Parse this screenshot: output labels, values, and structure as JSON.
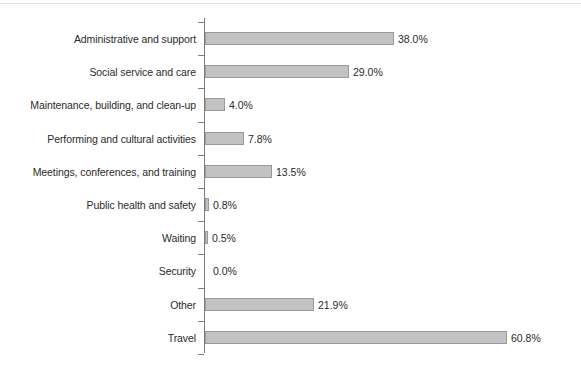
{
  "chart_data": {
    "type": "bar",
    "orientation": "horizontal",
    "title": "",
    "subtitle": "",
    "xlabel": "",
    "ylabel": "",
    "grid": false,
    "legend": false,
    "value_suffix": "%",
    "xlim": [
      0,
      60.8
    ],
    "categories": [
      "Administrative and support",
      "Social service and care",
      "Maintenance, building, and clean-up",
      "Performing and cultural activities",
      "Meetings, conferences, and training",
      "Public health and safety",
      "Waiting",
      "Security",
      "Other",
      "Travel"
    ],
    "values": [
      38.0,
      29.0,
      4.0,
      7.8,
      13.5,
      0.8,
      0.5,
      0.0,
      21.9,
      60.8
    ],
    "value_labels": [
      "38.0%",
      "29.0%",
      "4.0%",
      "7.8%",
      "13.5%",
      "0.8%",
      "0.5%",
      "0.0%",
      "21.9%",
      "60.8%"
    ]
  },
  "style": {
    "bar_fill": "#c2c2c2",
    "bar_stroke": "#9a9a9a",
    "axis_color": "#7d7d7d",
    "text_color": "#2b2b2b",
    "background": "#ffffff"
  }
}
